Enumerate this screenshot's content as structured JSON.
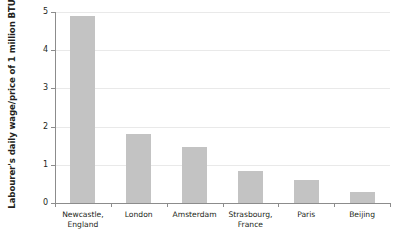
{
  "chart_data": {
    "type": "bar",
    "title": "",
    "xlabel": "",
    "ylabel": "Labourer's daily wage/price of 1 million BTUs",
    "categories": [
      "Newcastle,\nEngland",
      "London",
      "Amsterdam",
      "Strasbourg,\nFrance",
      "Paris",
      "Beijing"
    ],
    "values": [
      4.9,
      1.8,
      1.47,
      0.84,
      0.6,
      0.3
    ],
    "ylim": [
      0,
      5
    ],
    "yticks": [
      "0",
      "1",
      "2",
      "3",
      "4",
      "5"
    ],
    "grid": true,
    "legend": "none",
    "colors": {
      "bar_fill": "#c3c3c3",
      "gridline": "#e9e9e9",
      "axis": "#8c8c8c",
      "text": "#231f20",
      "background": "#ffffff"
    }
  }
}
